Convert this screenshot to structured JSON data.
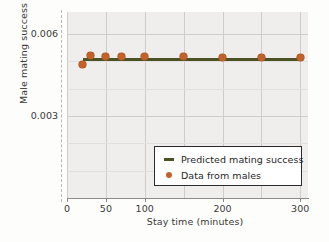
{
  "chart_data": {
    "type": "scatter",
    "title": "",
    "xlabel": "Stay time (minutes)",
    "ylabel": "Male mating success",
    "xlim": [
      0,
      310
    ],
    "ylim": [
      0.0,
      0.0068
    ],
    "grid": true,
    "legend_position": "lower right",
    "x_ticks": [
      {
        "value": 0,
        "label": "0"
      },
      {
        "value": 50,
        "label": "50"
      },
      {
        "value": 100,
        "label": "100"
      },
      {
        "value": 200,
        "label": "200"
      },
      {
        "value": 300,
        "label": "300"
      }
    ],
    "y_ticks": [
      {
        "value": 0.003,
        "label": "0.003"
      },
      {
        "value": 0.006,
        "label": "0.006"
      }
    ],
    "series": [
      {
        "name": "Predicted mating success",
        "type": "line",
        "color": "#4a5226",
        "x": [
          20,
          300
        ],
        "values": [
          0.00505,
          0.00507
        ]
      },
      {
        "name": "Data from males",
        "type": "scatter",
        "color": "#c0622d",
        "x": [
          20,
          30,
          50,
          70,
          100,
          150,
          200,
          250,
          300
        ],
        "values": [
          0.00487,
          0.00521,
          0.00519,
          0.00516,
          0.00517,
          0.00516,
          0.00515,
          0.00514,
          0.00513
        ]
      }
    ]
  },
  "legend": {
    "entries": [
      {
        "label": "Predicted mating success",
        "marker": "line",
        "color": "#4a5226"
      },
      {
        "label": "Data from males",
        "marker": "dot",
        "color": "#c0622d"
      }
    ]
  }
}
